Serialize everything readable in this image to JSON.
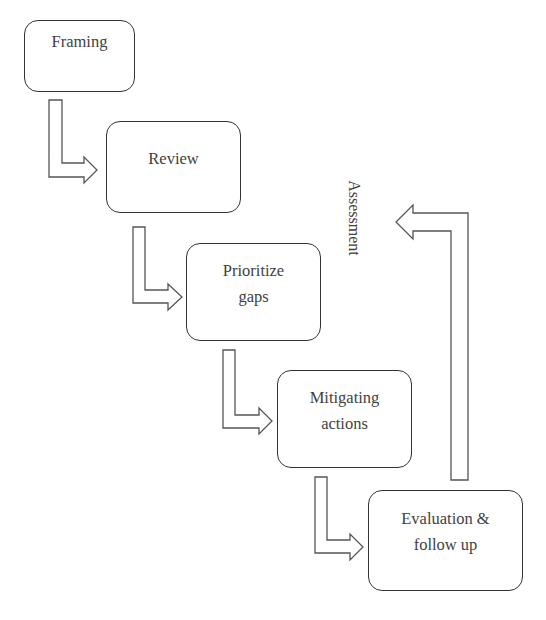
{
  "diagram": {
    "type": "process-flow",
    "steps": [
      {
        "id": "framing",
        "lines": [
          "Framing"
        ]
      },
      {
        "id": "review",
        "lines": [
          "Review"
        ]
      },
      {
        "id": "prioritize-gaps",
        "lines": [
          "Prioritize",
          "gaps"
        ]
      },
      {
        "id": "mitigating-actions",
        "lines": [
          "Mitigating",
          "actions"
        ]
      },
      {
        "id": "evaluation-follow-up",
        "lines": [
          "Evaluation &",
          "follow up"
        ]
      }
    ],
    "feedback_loop": {
      "label": "Assessment",
      "from": "evaluation-follow-up",
      "direction": "upward-return"
    },
    "colors": {
      "stroke": "#333333",
      "text": "#3f3f3f",
      "background": "#ffffff"
    }
  }
}
